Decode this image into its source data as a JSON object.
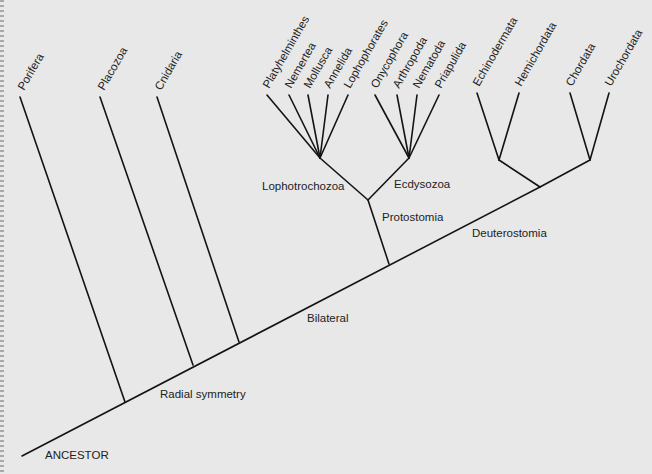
{
  "diagram": {
    "title": "",
    "root_label": "ANCESTOR",
    "clade_labels": {
      "radial_symmetry": "Radial symmetry",
      "bilateral": "Bilateral",
      "protostomia": "Protostomia",
      "lophotrochozoa": "Lophotrochozoa",
      "ecdysozoa": "Ecdysozoa",
      "deuterostomia": "Deuterostomia"
    },
    "taxa": {
      "porifera": "Porifera",
      "placozoa": "Placozoa",
      "cnidaria": "Cnidaria",
      "platyhelminthes": "Platyhelminthes",
      "nemertea": "Nemertea",
      "mollusca": "Mollusca",
      "annelida": "Annelida",
      "lophophorates": "Lophophorates",
      "onycophora": "Onycophora",
      "arthropoda": "Arthropoda",
      "nematoda": "Nematoda",
      "priapulida": "Priapulida",
      "echinodermata": "Echinodermata",
      "hemichordata": "Hemichordata",
      "chordata": "Chordata",
      "urochordata": "Urochordata"
    },
    "tree": {
      "name": "ANCESTOR",
      "children": [
        {
          "name": "Porifera"
        },
        {
          "name": "Placozoa"
        },
        {
          "name": "Cnidaria"
        },
        {
          "name": "Bilateral",
          "children": [
            {
              "name": "Protostomia",
              "children": [
                {
                  "name": "Lophotrochozoa",
                  "children": [
                    {
                      "name": "Platyhelminthes"
                    },
                    {
                      "name": "Nemertea"
                    },
                    {
                      "name": "Mollusca"
                    },
                    {
                      "name": "Annelida"
                    },
                    {
                      "name": "Lophophorates"
                    }
                  ]
                },
                {
                  "name": "Ecdysozoa",
                  "children": [
                    {
                      "name": "Onycophora"
                    },
                    {
                      "name": "Arthropoda"
                    },
                    {
                      "name": "Nematoda"
                    },
                    {
                      "name": "Priapulida"
                    }
                  ]
                }
              ]
            },
            {
              "name": "Deuterostomia",
              "children": [
                {
                  "name": "",
                  "children": [
                    {
                      "name": "Echinodermata"
                    },
                    {
                      "name": "Hemichordata"
                    }
                  ]
                },
                {
                  "name": "",
                  "children": [
                    {
                      "name": "Chordata"
                    },
                    {
                      "name": "Urochordata"
                    }
                  ]
                }
              ]
            }
          ]
        }
      ]
    }
  }
}
